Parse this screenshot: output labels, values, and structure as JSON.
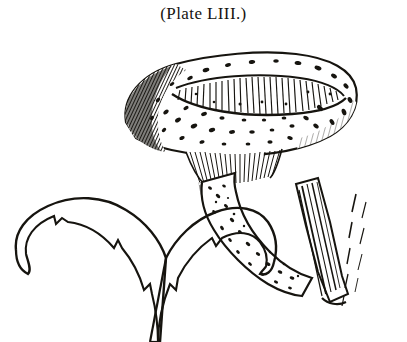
{
  "plate": {
    "caption": "(Plate LIII.)",
    "ink_color": "#16140f",
    "background_color": "#ffffff"
  },
  "illustration": {
    "name": "scaly-mushroom-engraving",
    "medium": "pen-and-ink line engraving",
    "subjects": [
      {
        "id": "fruiting-body",
        "label": "mushroom fruiting body",
        "parts": [
          {
            "id": "cap",
            "label": "cap with dark scales and central depression"
          },
          {
            "id": "gills",
            "label": "radiating gills beneath cap"
          },
          {
            "id": "stem",
            "label": "curved speckled stem"
          },
          {
            "id": "wood",
            "label": "wood fragment at stem base"
          }
        ]
      },
      {
        "id": "gill-section-left",
        "label": "left gill cross-section with toothed edge"
      },
      {
        "id": "gill-section-right",
        "label": "right gill cross-section with toothed edge"
      }
    ]
  }
}
